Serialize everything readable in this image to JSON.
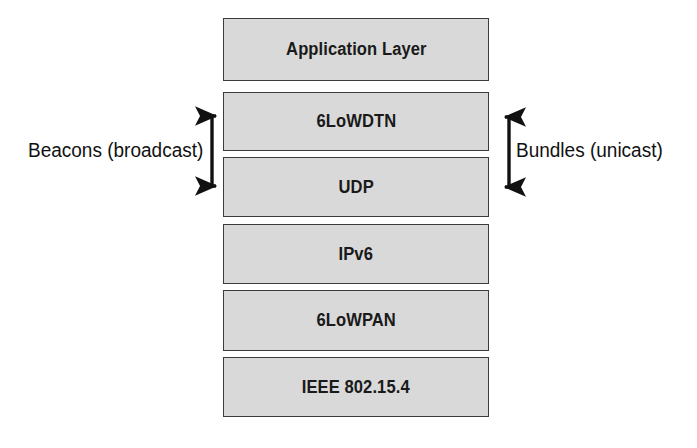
{
  "diagram": {
    "background_color": "#ffffff",
    "box_fill_color": "#d9d9d9",
    "box_border_color": "#3b3b3b",
    "text_color": "#1a1a1a",
    "layers": [
      {
        "label": "Application Layer"
      },
      {
        "label": "6LoWDTN"
      },
      {
        "label": "UDP"
      },
      {
        "label": "IPv6"
      },
      {
        "label": "6LoWPAN"
      },
      {
        "label": "IEEE 802.15.4"
      }
    ],
    "annotations": {
      "left": {
        "label": "Beacons (broadcast)",
        "arrow_direction": "right",
        "icon": "bracket-arrow-right-icon"
      },
      "right": {
        "label": "Bundles (unicast)",
        "arrow_direction": "left",
        "icon": "bracket-arrow-left-icon"
      }
    }
  }
}
